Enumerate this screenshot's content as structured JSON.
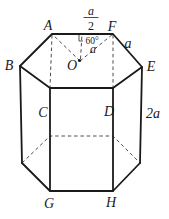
{
  "colors": {
    "ink": "#1a1a1a",
    "background": "#ffffff"
  },
  "figure": {
    "vertex_labels": {
      "A": "A",
      "B": "B",
      "C": "C",
      "D": "D",
      "E": "E",
      "F": "F",
      "G": "G",
      "H": "H"
    },
    "center_label": "O",
    "measurements": {
      "half_top_edge_numerator": "a",
      "half_top_edge_denominator": "2",
      "angle_at_f": "60°",
      "segment_of": "a",
      "edge_fe": "a",
      "lateral_height": "2a"
    }
  }
}
